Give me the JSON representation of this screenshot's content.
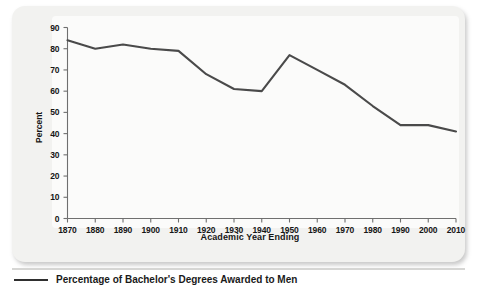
{
  "figure": {
    "caption": "Percentage of Bachelor's Degrees Awarded to Men"
  },
  "chart_data": {
    "type": "line",
    "title": "",
    "xlabel": "Academic Year Ending",
    "ylabel": "Percent",
    "categories": [
      1870,
      1880,
      1890,
      1900,
      1910,
      1920,
      1930,
      1940,
      1950,
      1960,
      1970,
      1980,
      1990,
      2000,
      2010
    ],
    "values": [
      84,
      80,
      82,
      80,
      79,
      68,
      61,
      60,
      77,
      70,
      63,
      53,
      44,
      44,
      41
    ],
    "series": [
      {
        "name": "Percentage of bachelor's degrees awarded to men",
        "values": [
          84,
          80,
          82,
          80,
          79,
          68,
          61,
          60,
          77,
          70,
          63,
          53,
          44,
          44,
          41
        ]
      }
    ],
    "xlim": [
      1870,
      2010
    ],
    "ylim": [
      0,
      90
    ],
    "ytick_labels": [
      "0",
      "10",
      "20",
      "30",
      "40",
      "50",
      "60",
      "70",
      "80",
      "90"
    ],
    "yticks": [
      0,
      10,
      20,
      30,
      40,
      50,
      60,
      70,
      80,
      90
    ],
    "xtick_labels": [
      "1870",
      "1880",
      "1890",
      "1900",
      "1910",
      "1920",
      "1930",
      "1940",
      "1950",
      "1960",
      "1970",
      "1980",
      "1990",
      "2000",
      "2010"
    ],
    "grid": false,
    "legend": false,
    "markers": false,
    "line_color": "#4a4a4a",
    "panel_color": "#f2f2f0",
    "axis_color": "#6f6f6f"
  }
}
